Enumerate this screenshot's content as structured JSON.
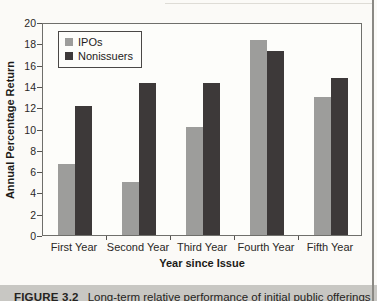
{
  "chart_data": {
    "type": "bar",
    "categories": [
      "First Year",
      "Second Year",
      "Third Year",
      "Fourth Year",
      "Fifth Year"
    ],
    "series": [
      {
        "name": "IPOs",
        "color": "#9d9d9b",
        "values": [
          6.7,
          5.0,
          10.2,
          18.5,
          13.1
        ]
      },
      {
        "name": "Nonissuers",
        "color": "#3d3939",
        "values": [
          12.2,
          14.4,
          14.4,
          17.4,
          14.9
        ]
      }
    ],
    "title": "",
    "xlabel": "Year since Issue",
    "ylabel": "Annual Percentage Return",
    "ylim": [
      0,
      20
    ],
    "ytick_step": 2,
    "grid": false,
    "legend_position": "upper-left"
  },
  "caption": {
    "label": "FIGURE 3.2",
    "text": "Long-term relative performance of initial public offerings"
  }
}
